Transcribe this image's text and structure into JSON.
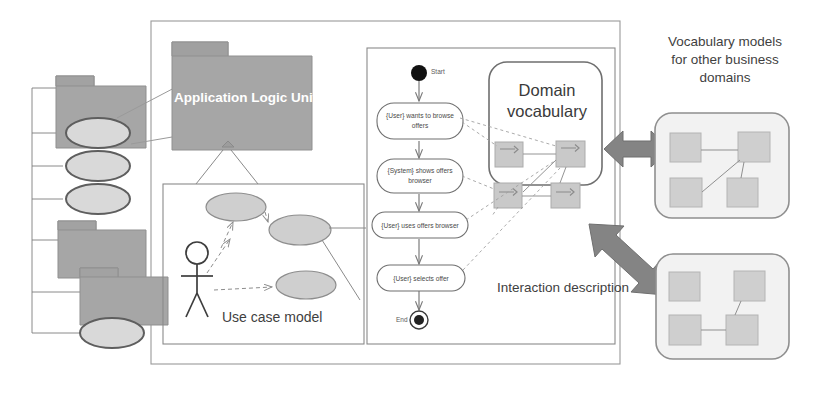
{
  "diagram": {
    "type": "uml-architecture-diagram"
  },
  "packages": {
    "main": {
      "label": "Application Logic Unit"
    },
    "left_tree": {
      "note": "vertical tree of model packages and use-case ellipses on the left edge",
      "nodes": [
        {
          "kind": "package",
          "index": 0
        },
        {
          "kind": "ellipse",
          "index": 1
        },
        {
          "kind": "ellipse",
          "index": 2
        },
        {
          "kind": "ellipse",
          "index": 3
        },
        {
          "kind": "package",
          "index": 4
        },
        {
          "kind": "package",
          "index": 5
        },
        {
          "kind": "ellipse",
          "index": 6
        }
      ]
    }
  },
  "frames": {
    "use_case_model": {
      "label": "Use case model"
    },
    "interaction_description": {
      "label": "Interaction description"
    },
    "domain_vocabulary": {
      "label": "Domain\nvocabulary"
    }
  },
  "activity": {
    "start_label": "Start",
    "end_label": "End",
    "steps": [
      {
        "id": 1,
        "text": "{User} wants to browse\noffers"
      },
      {
        "id": 2,
        "text": "{System} shows offers\nbrowser"
      },
      {
        "id": 3,
        "text": "{User} uses offers browser"
      },
      {
        "id": 4,
        "text": "{User} selects offer"
      }
    ]
  },
  "vocabulary": {
    "concepts": [
      {
        "id": "v1",
        "row": 0,
        "col": 0
      },
      {
        "id": "v2",
        "row": 0,
        "col": 1
      },
      {
        "id": "v3",
        "row": 1,
        "col": 0
      },
      {
        "id": "v4",
        "row": 1,
        "col": 1
      }
    ]
  },
  "side_note": {
    "text": "Vocabulary models\nfor other business\ndomains"
  },
  "other_domains": [
    {
      "id": "domain-a",
      "concepts": 4
    },
    {
      "id": "domain-b",
      "concepts": 4
    }
  ],
  "connectors": {
    "arrow_horizontal": "double-headed-arrow",
    "arrow_diagonal": "double-headed-arrow-diagonal"
  },
  "colors": {
    "package_fill": "#a6a6a6",
    "package_stroke": "#8f8f8f",
    "ellipse_fill": "#d9d9d9",
    "ellipse_stroke": "#6f6f6f",
    "big_arrow": "#848484",
    "concept_fill": "#c9c9c9",
    "concept_stroke": "#aeaeae",
    "frame_stroke": "#8a8a8a",
    "text": "#4a4a4a",
    "background": "#ffffff"
  }
}
